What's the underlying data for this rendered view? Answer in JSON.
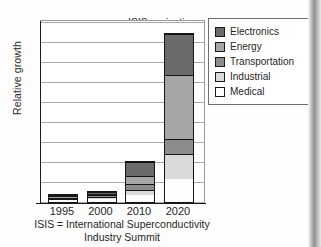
{
  "chart_data": {
    "type": "bar",
    "subtype": "stacked-bar",
    "title": "ISIS projection",
    "xlabel": "",
    "ylabel": "Relative growth",
    "categories": [
      "1995",
      "2000",
      "2010",
      "2020"
    ],
    "series": [
      {
        "name": "Medical",
        "color": "#fdfdfd",
        "values": [
          1.5,
          3.0,
          7.0,
          23.0
        ]
      },
      {
        "name": "Industrial",
        "color": "#d9d9d9",
        "values": [
          0.8,
          2.0,
          5.0,
          25.0
        ]
      },
      {
        "name": "Transportation",
        "color": "#8c8c8c",
        "values": [
          0.4,
          1.5,
          6.0,
          15.0
        ]
      },
      {
        "name": "Energy",
        "color": "#a6a6a6",
        "values": [
          0.4,
          1.5,
          8.0,
          65.0
        ]
      },
      {
        "name": "Electronics",
        "color": "#6b6b6b",
        "values": [
          0.4,
          2.0,
          14.0,
          42.0
        ]
      }
    ],
    "totals": [
      3.5,
      10.0,
      40.0,
      170.0
    ],
    "ylim": [
      0,
      183
    ],
    "grid": true,
    "gridlines": 10,
    "legend_position": "top-right",
    "legend_entries": [
      "Electronics",
      "Energy",
      "Transportation",
      "Industrial",
      "Medical"
    ],
    "annotations": [
      "ISIS projection"
    ],
    "caption": "ISIS = International Superconductivity Industry Summit"
  },
  "chart": {
    "title": "ISIS projection",
    "ylabel": "Relative growth",
    "xticks": [
      "1995",
      "2000",
      "2010",
      "2020"
    ]
  },
  "legend": {
    "items": [
      {
        "label": "Electronics",
        "color": "#6b6b6b"
      },
      {
        "label": "Energy",
        "color": "#a6a6a6"
      },
      {
        "label": "Transportation",
        "color": "#8c8c8c"
      },
      {
        "label": "Industrial",
        "color": "#d9d9d9"
      },
      {
        "label": "Medical",
        "color": "#fdfdfd"
      }
    ]
  },
  "caption": {
    "line1": "ISIS = International Superconductivity",
    "line2": "Industry Summit"
  }
}
